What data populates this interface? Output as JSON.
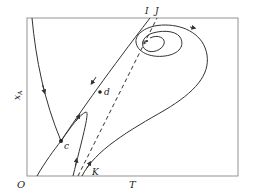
{
  "diagram": {
    "type": "phase-plane",
    "axes": {
      "origin_label": "O",
      "x_label": "T",
      "y_label": "x",
      "y_label_subscript": "A"
    },
    "curve_labels": {
      "I": "I",
      "J": "J"
    },
    "points": {
      "c": "c",
      "d": "d",
      "e": "e",
      "K": "K"
    },
    "colors": {
      "line": "#333333",
      "frame": "#888888",
      "background": "#ffffff"
    }
  }
}
